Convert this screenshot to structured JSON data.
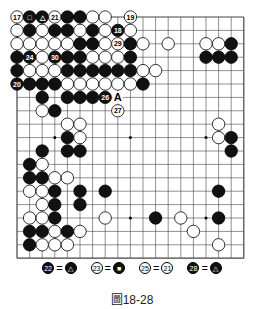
{
  "board": {
    "size": 19,
    "x0": 17,
    "y0": 17,
    "dx": 12.6,
    "dy": 13.4,
    "stones": [
      [
        0,
        0,
        "w",
        "17"
      ],
      [
        1,
        0,
        "b",
        "□"
      ],
      [
        2,
        0,
        "b",
        "△"
      ],
      [
        3,
        0,
        "w",
        "21"
      ],
      [
        4,
        0,
        "b",
        ""
      ],
      [
        5,
        0,
        "b",
        ""
      ],
      [
        6,
        0,
        "w",
        ""
      ],
      [
        7,
        0,
        "w",
        ""
      ],
      [
        9,
        0,
        "w",
        "19"
      ],
      [
        0,
        1,
        "w",
        ""
      ],
      [
        1,
        1,
        "b",
        ""
      ],
      [
        2,
        1,
        "w",
        ""
      ],
      [
        3,
        1,
        "b",
        ""
      ],
      [
        4,
        1,
        "b",
        ""
      ],
      [
        5,
        1,
        "w",
        ""
      ],
      [
        6,
        1,
        "b",
        ""
      ],
      [
        7,
        1,
        "w",
        ""
      ],
      [
        8,
        1,
        "b",
        "18"
      ],
      [
        9,
        1,
        "w",
        ""
      ],
      [
        0,
        2,
        "w",
        ""
      ],
      [
        1,
        2,
        "w",
        ""
      ],
      [
        2,
        2,
        "w",
        ""
      ],
      [
        3,
        2,
        "w",
        ""
      ],
      [
        4,
        2,
        "w",
        ""
      ],
      [
        5,
        2,
        "b",
        ""
      ],
      [
        6,
        2,
        "b",
        ""
      ],
      [
        7,
        2,
        "w",
        ""
      ],
      [
        8,
        2,
        "w",
        "29"
      ],
      [
        9,
        2,
        "b",
        ""
      ],
      [
        10,
        2,
        "w",
        ""
      ],
      [
        12,
        2,
        "w",
        ""
      ],
      [
        15,
        2,
        "w",
        ""
      ],
      [
        16,
        2,
        "w",
        ""
      ],
      [
        17,
        2,
        "b",
        ""
      ],
      [
        0,
        3,
        "b",
        ""
      ],
      [
        1,
        3,
        "b",
        "24"
      ],
      [
        2,
        3,
        "w",
        ""
      ],
      [
        3,
        3,
        "b",
        "30"
      ],
      [
        4,
        3,
        "b",
        ""
      ],
      [
        5,
        3,
        "b",
        ""
      ],
      [
        6,
        3,
        "w",
        ""
      ],
      [
        7,
        3,
        "w",
        ""
      ],
      [
        8,
        3,
        "w",
        ""
      ],
      [
        9,
        3,
        "b",
        ""
      ],
      [
        15,
        3,
        "b",
        ""
      ],
      [
        16,
        3,
        "b",
        ""
      ],
      [
        17,
        3,
        "b",
        ""
      ],
      [
        0,
        4,
        "b",
        ""
      ],
      [
        1,
        4,
        "w",
        ""
      ],
      [
        2,
        4,
        "w",
        ""
      ],
      [
        3,
        4,
        "w",
        ""
      ],
      [
        4,
        4,
        "b",
        ""
      ],
      [
        5,
        4,
        "b",
        ""
      ],
      [
        6,
        4,
        "b",
        ""
      ],
      [
        7,
        4,
        "b",
        ""
      ],
      [
        8,
        4,
        "b",
        ""
      ],
      [
        9,
        4,
        "b",
        ""
      ],
      [
        10,
        4,
        "w",
        ""
      ],
      [
        11,
        4,
        "w",
        ""
      ],
      [
        0,
        5,
        "b",
        "20"
      ],
      [
        1,
        5,
        "b",
        ""
      ],
      [
        2,
        5,
        "b",
        ""
      ],
      [
        3,
        5,
        "b",
        ""
      ],
      [
        4,
        5,
        "w",
        ""
      ],
      [
        5,
        5,
        "w",
        ""
      ],
      [
        6,
        5,
        "w",
        ""
      ],
      [
        7,
        5,
        "w",
        ""
      ],
      [
        8,
        5,
        "w",
        ""
      ],
      [
        9,
        5,
        "w",
        ""
      ],
      [
        10,
        5,
        "b",
        ""
      ],
      [
        2,
        6,
        "b",
        ""
      ],
      [
        4,
        6,
        "b",
        ""
      ],
      [
        5,
        6,
        "b",
        ""
      ],
      [
        6,
        6,
        "b",
        ""
      ],
      [
        7,
        6,
        "b",
        "26"
      ],
      [
        2,
        7,
        "w",
        ""
      ],
      [
        3,
        7,
        "b",
        ""
      ],
      [
        8,
        7,
        "w",
        "27"
      ],
      [
        4,
        8,
        "w",
        ""
      ],
      [
        5,
        8,
        "w",
        ""
      ],
      [
        16,
        8,
        "w",
        ""
      ],
      [
        4,
        9,
        "b",
        ""
      ],
      [
        5,
        9,
        "w",
        ""
      ],
      [
        16,
        9,
        "w",
        ""
      ],
      [
        17,
        9,
        "b",
        ""
      ],
      [
        2,
        10,
        "b",
        ""
      ],
      [
        4,
        10,
        "b",
        ""
      ],
      [
        5,
        10,
        "b",
        ""
      ],
      [
        17,
        10,
        "b",
        ""
      ],
      [
        1,
        11,
        "b",
        ""
      ],
      [
        2,
        11,
        "w",
        ""
      ],
      [
        1,
        12,
        "b",
        ""
      ],
      [
        2,
        12,
        "b",
        ""
      ],
      [
        3,
        12,
        "w",
        ""
      ],
      [
        4,
        12,
        "w",
        ""
      ],
      [
        1,
        13,
        "w",
        ""
      ],
      [
        2,
        13,
        "w",
        ""
      ],
      [
        3,
        13,
        "b",
        ""
      ],
      [
        5,
        13,
        "b",
        ""
      ],
      [
        7,
        13,
        "b",
        ""
      ],
      [
        16,
        13,
        "b",
        ""
      ],
      [
        2,
        14,
        "w",
        ""
      ],
      [
        3,
        14,
        "b",
        ""
      ],
      [
        5,
        14,
        "b",
        ""
      ],
      [
        1,
        15,
        "w",
        ""
      ],
      [
        2,
        15,
        "w",
        ""
      ],
      [
        3,
        15,
        "b",
        ""
      ],
      [
        7,
        15,
        "w",
        ""
      ],
      [
        11,
        15,
        "b",
        ""
      ],
      [
        13,
        15,
        "w",
        ""
      ],
      [
        16,
        15,
        "b",
        ""
      ],
      [
        1,
        16,
        "b",
        ""
      ],
      [
        2,
        16,
        "b",
        ""
      ],
      [
        3,
        16,
        "w",
        ""
      ],
      [
        4,
        16,
        "b",
        ""
      ],
      [
        5,
        16,
        "w",
        ""
      ],
      [
        14,
        16,
        "w",
        ""
      ],
      [
        1,
        17,
        "b",
        ""
      ],
      [
        2,
        17,
        "w",
        ""
      ],
      [
        3,
        17,
        "w",
        ""
      ],
      [
        4,
        17,
        "w",
        ""
      ],
      [
        16,
        17,
        "w",
        ""
      ]
    ],
    "marks": [
      [
        8,
        6,
        "A"
      ]
    ],
    "hoshi": [
      [
        3,
        3
      ],
      [
        9,
        3
      ],
      [
        15,
        3
      ],
      [
        3,
        9
      ],
      [
        9,
        9
      ],
      [
        15,
        9
      ],
      [
        3,
        15
      ],
      [
        9,
        15
      ],
      [
        15,
        15
      ]
    ]
  },
  "legend": [
    {
      "left": "22",
      "leftColor": "b",
      "right": "△",
      "rightColor": "b"
    },
    {
      "left": "23",
      "leftColor": "w",
      "right": "■",
      "rightColor": "b"
    },
    {
      "left": "25",
      "leftColor": "w",
      "right": "21",
      "rightColor": "w"
    },
    {
      "left": "28",
      "leftColor": "b",
      "right": "△",
      "rightColor": "b"
    }
  ],
  "caption": "圖18-28"
}
